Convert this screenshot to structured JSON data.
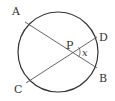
{
  "diagram": {
    "type": "circle-intersecting-chords",
    "circle": {
      "cx": 58,
      "cy": 52,
      "r": 40,
      "stroke": "#333333"
    },
    "chord_color": "#555555",
    "points": {
      "A": {
        "label": "A",
        "x": 25,
        "y": 22
      },
      "B": {
        "label": "B",
        "x": 97,
        "y": 68
      },
      "C": {
        "label": "C",
        "x": 26,
        "y": 83
      },
      "D": {
        "label": "D",
        "x": 97,
        "y": 37
      },
      "P": {
        "label": "P",
        "x": 71,
        "y": 52
      }
    },
    "chords": [
      {
        "from": "A",
        "to": "B"
      },
      {
        "from": "C",
        "to": "D"
      }
    ],
    "angle_marker": {
      "vertex": "P",
      "between": [
        "D",
        "B"
      ],
      "label": "x"
    }
  }
}
